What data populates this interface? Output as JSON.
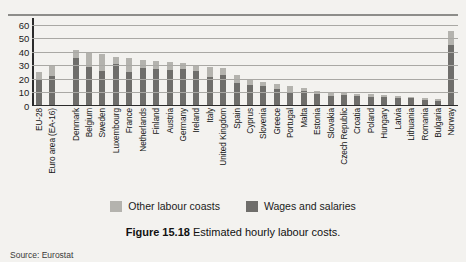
{
  "figure": {
    "number_label": "Figure 15.18",
    "caption_text": "Estimated hourly labour costs.",
    "source": "Source: Eurostat"
  },
  "legend": {
    "position": "bottom-center",
    "items": [
      {
        "label": "Other labour coasts",
        "color": "#b4b3ae",
        "name": "other-labour-costs"
      },
      {
        "label": "Wages and salaries",
        "color": "#6f6e6b",
        "name": "wages-and-salaries"
      }
    ]
  },
  "chart_data": {
    "type": "bar",
    "stacked": true,
    "title": "Estimated hourly labour costs.",
    "xlabel": "",
    "ylabel": "",
    "ylim": [
      0,
      65
    ],
    "yticks": [
      0,
      10,
      20,
      30,
      40,
      50,
      60
    ],
    "grid": true,
    "legend_position": "bottom-center",
    "group_break_after_index": 1,
    "categories": [
      "EU-28",
      "Euro area (EA-16)",
      "Denmark",
      "Belgium",
      "Sweden",
      "Luxembourg",
      "France",
      "Netherlands",
      "Finland",
      "Austria",
      "Germany",
      "Ireland",
      "Italy",
      "United Kingdom",
      "Spain",
      "Cyprus",
      "Slovenia",
      "Greece",
      "Portugal",
      "Malta",
      "Estonia",
      "Slovakia",
      "Czech Republic",
      "Croatia",
      "Poland",
      "Hungary",
      "Latvia",
      "Lithuania",
      "Romania",
      "Bulgaria",
      "Norway"
    ],
    "series": [
      {
        "name": "Wages and salaries",
        "color": "#6f6e6b",
        "values": [
          18.5,
          21.0,
          34.0,
          27.5,
          25.0,
          30.0,
          24.0,
          27.0,
          26.5,
          25.5,
          26.0,
          25.0,
          20.5,
          22.0,
          16.0,
          14.5,
          13.5,
          11.5,
          9.5,
          10.0,
          7.5,
          6.5,
          7.0,
          6.0,
          5.5,
          5.2,
          5.0,
          4.5,
          3.6,
          2.9,
          44.0
        ]
      },
      {
        "name": "Other labour coasts",
        "color": "#b4b3ae",
        "values": [
          5.5,
          7.5,
          6.0,
          10.5,
          12.0,
          5.0,
          10.0,
          6.0,
          5.5,
          6.0,
          4.5,
          4.0,
          7.5,
          5.0,
          5.5,
          3.5,
          3.5,
          4.0,
          4.0,
          2.0,
          2.5,
          3.0,
          2.5,
          2.0,
          2.0,
          2.0,
          1.5,
          1.3,
          1.2,
          1.0,
          10.0
        ]
      }
    ],
    "totals": [
      24,
      28.5,
      40,
      38,
      37,
      35,
      34,
      33,
      32,
      31.5,
      30.5,
      29,
      28,
      27,
      21.5,
      18,
      17,
      15.5,
      13.5,
      12,
      10,
      9.5,
      9.5,
      8,
      7.5,
      7.2,
      6.5,
      5.8,
      4.8,
      3.9,
      54
    ]
  }
}
